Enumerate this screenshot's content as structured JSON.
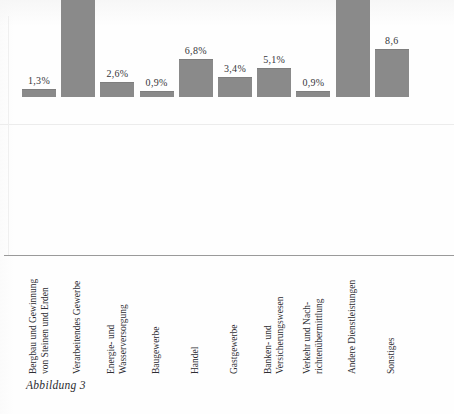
{
  "page": {
    "caption": "Abbildung 3",
    "top_cut_text": "•  •   •        •",
    "bar_color": "#8a8a8a",
    "baseline_color": "#9a9a9a",
    "background_color": "#fefefe"
  },
  "chart_data": {
    "type": "bar",
    "title": "",
    "xlabel": "",
    "ylabel": "",
    "ylim": [
      0,
      42
    ],
    "grid": false,
    "legend": "none",
    "categories": [
      "Bergbau und Gewinnung\nvon Steinen und Erden",
      "Verarbeitendes Gewerbe",
      "Energie- und\nWasserversorgung",
      "Baugewerbe",
      "Handel",
      "Gastgewerbe",
      "Banken- und\nVersicherungswesen",
      "Verkehr und Nach-\nrichtenübermittlung",
      "Andere Dienstleistungen",
      "Sonstiges"
    ],
    "values": [
      1.3,
      32.1,
      2.6,
      0.9,
      6.8,
      3.4,
      5.1,
      0.9,
      38.5,
      8.6
    ],
    "value_labels": [
      "1,3%",
      "32,1%",
      "2,6%",
      "0,9%",
      "6,8%",
      "3,4%",
      "5,1%",
      "0,9%",
      "38,5%",
      "8,6"
    ]
  }
}
